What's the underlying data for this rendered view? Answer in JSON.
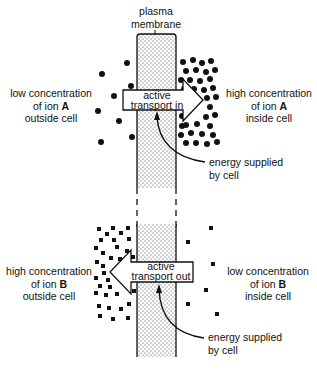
{
  "membrane": {
    "label_line1": "plasma",
    "label_line2": "membrane"
  },
  "top_panel": {
    "left_label": {
      "line1": "low concentration",
      "line2_prefix": "of ion ",
      "ion": "A",
      "line3": "outside cell"
    },
    "right_label": {
      "line1": "high concentration",
      "line2_prefix": "of ion ",
      "ion": "A",
      "line3": "inside cell"
    },
    "arrow": {
      "line1": "active",
      "line2": "transport in",
      "direction": "right"
    },
    "energy": {
      "line1": "energy supplied",
      "line2": "by cell"
    },
    "ion_shape": "circle"
  },
  "bottom_panel": {
    "left_label": {
      "line1": "high concentration",
      "line2_prefix": "of ion ",
      "ion": "B",
      "line3": "outside cell"
    },
    "right_label": {
      "line1": "low concentration",
      "line2_prefix": "of ion ",
      "ion": "B",
      "line3": "inside cell"
    },
    "arrow": {
      "line1": "active",
      "line2": "transport out",
      "direction": "left"
    },
    "energy": {
      "line1": "energy supplied",
      "line2": "by cell"
    },
    "ion_shape": "square"
  }
}
